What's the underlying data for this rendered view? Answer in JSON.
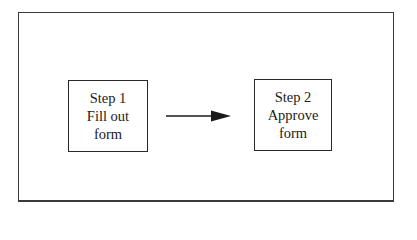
{
  "diagram": {
    "type": "flowchart",
    "steps": [
      {
        "id": "step-1",
        "lines": [
          "Step 1",
          "Fill out",
          "form"
        ]
      },
      {
        "id": "step-2",
        "lines": [
          "Step 2",
          "Approve",
          "form"
        ]
      }
    ],
    "connections": [
      {
        "from": "step-1",
        "to": "step-2",
        "style": "solid-arrow"
      }
    ],
    "colors": {
      "stroke": "#2a2a2a",
      "background": "#ffffff",
      "text": "#1a1a1a"
    }
  }
}
